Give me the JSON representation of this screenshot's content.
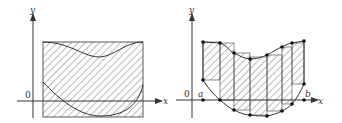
{
  "figures": [
    {
      "id": "left",
      "axis_labels": {
        "x": "x",
        "y": "y",
        "origin": "0"
      },
      "description": "Rectangle region between two curves, fully hatched"
    },
    {
      "id": "right",
      "axis_labels": {
        "x": "x",
        "y": "y",
        "origin": "0",
        "a": "a",
        "b": "b"
      },
      "description": "Region between two curves approximated by hatched rectangular strips with sample points"
    }
  ],
  "colors": {
    "line": "#333333",
    "hatch": "#555555",
    "background": "#ffffff"
  }
}
